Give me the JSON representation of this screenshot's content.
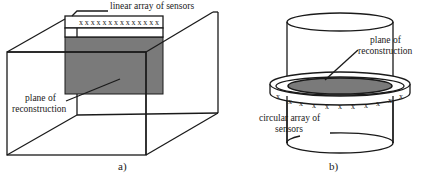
{
  "figure_a": {
    "caption": "a)",
    "sensor_label": "linear array of sensors",
    "plane_label_line1": "plane of",
    "plane_label_line2": "reconstruction",
    "sensor_marks": "x x x x x x x x x x x x x x",
    "sensor_count": 14
  },
  "figure_b": {
    "caption": "b)",
    "plane_label_line1": "plane of",
    "plane_label_line2": "reconstruction",
    "sensor_label_line1": "circular array of",
    "sensor_label_line2": "sensors",
    "sensor_mark": "x",
    "visible_sensor_count": 11
  },
  "colors": {
    "line": "#1a1a1a",
    "plane_fill": "#7a7a7a",
    "background": "#ffffff"
  }
}
